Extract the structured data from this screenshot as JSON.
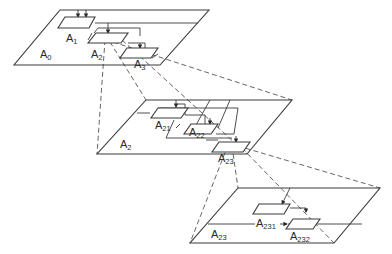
{
  "diagram": {
    "type": "hierarchical-decomposition",
    "levels": [
      {
        "name": "top-level",
        "plane_label": "A",
        "plane_sub": "0",
        "boxes": [
          {
            "label": "A",
            "sub": "1"
          },
          {
            "label": "A",
            "sub": "2"
          },
          {
            "label": "A",
            "sub": "3"
          }
        ]
      },
      {
        "name": "middle-level",
        "plane_label": "A",
        "plane_sub": "2",
        "boxes": [
          {
            "label": "A",
            "sub": "21"
          },
          {
            "label": "A",
            "sub": "22"
          },
          {
            "label": "A",
            "sub": "23"
          }
        ]
      },
      {
        "name": "bottom-level",
        "plane_label": "A",
        "plane_sub": "23",
        "boxes": [
          {
            "label": "A",
            "sub": "231"
          },
          {
            "label": "A",
            "sub": "232"
          }
        ]
      }
    ],
    "colors": {
      "line": "#3a3a3a",
      "dash": "#555555",
      "background": "#ffffff"
    }
  }
}
